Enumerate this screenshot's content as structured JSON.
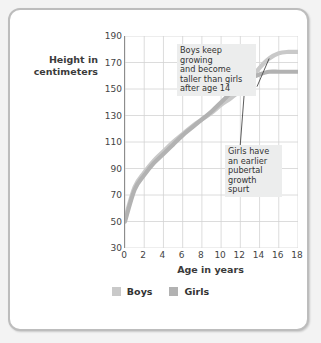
{
  "chart_data": {
    "type": "line",
    "title": "",
    "xlabel": "Age in years",
    "ylabel": "Height in centimeters",
    "ylabel_lines": [
      "Height in",
      "centimeters"
    ],
    "xlim": [
      0,
      18
    ],
    "ylim": [
      30,
      190
    ],
    "xticks": [
      0,
      2,
      4,
      6,
      8,
      10,
      12,
      14,
      16,
      18
    ],
    "yticks": [
      30,
      50,
      70,
      90,
      110,
      130,
      150,
      170,
      190
    ],
    "grid": true,
    "legend_position": "bottom",
    "series": [
      {
        "name": "Boys",
        "color": "#c9c9c9",
        "x": [
          0,
          1,
          2,
          3,
          4,
          5,
          6,
          7,
          8,
          9,
          10,
          11,
          12,
          13,
          14,
          15,
          16,
          17,
          18
        ],
        "values": [
          52,
          76,
          87,
          96,
          103,
          110,
          116,
          122,
          127,
          132,
          138,
          143,
          149,
          157,
          166,
          173,
          177,
          178,
          178
        ]
      },
      {
        "name": "Girls",
        "color": "#b2b2b2",
        "x": [
          0,
          1,
          2,
          3,
          4,
          5,
          6,
          7,
          8,
          9,
          10,
          11,
          12,
          13,
          14,
          15,
          16,
          17,
          18
        ],
        "values": [
          50,
          74,
          85,
          94,
          101,
          108,
          115,
          121,
          127,
          133,
          140,
          147,
          153,
          158,
          161,
          163,
          163,
          163,
          163
        ]
      }
    ],
    "annotations": [
      {
        "name": "boys-note",
        "text": "Boys keep growing and become taller than girls after age 14",
        "lines": [
          "Boys keep growing",
          "and become",
          "taller than girls",
          "after age 14"
        ],
        "points_to_series": "Boys",
        "points_to_age": 15
      },
      {
        "name": "girls-note",
        "text": "Girls have an earlier pubertal growth spurt",
        "lines": [
          "Girls have",
          "an earlier",
          "pubertal",
          "growth spurt"
        ],
        "points_to_series": "Girls",
        "points_to_age": 12.5
      }
    ]
  },
  "legend": {
    "items": [
      {
        "label": "Boys",
        "color": "#c9c9c9"
      },
      {
        "label": "Girls",
        "color": "#b2b2b2"
      }
    ]
  },
  "colors": {
    "card_background": "#ffffff",
    "card_border": "#bdbdbd",
    "page_background": "#f3f3f3",
    "grid": "#d3d3d3",
    "axis": "#8d8d8d",
    "text": "#333333",
    "annotation_background": "#eceded"
  }
}
